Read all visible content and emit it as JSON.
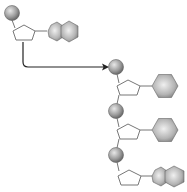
{
  "diagram": {
    "title": "",
    "colors": {
      "background": "#ffffff",
      "phosphate_light": "#e6e6e6",
      "phosphate_dark": "#6a6a6a",
      "base_light": "#ececec",
      "base_dark": "#7d7d7d",
      "sugar_fill": "#ffffff",
      "outline": "#777777",
      "arrow": "#222222"
    },
    "free_nucleotide": {
      "phosphate": {
        "cx": 12,
        "cy": 13,
        "r": 7
      },
      "base_type": "purine"
    },
    "arrow": {
      "from": [
        23,
        42
      ],
      "to": [
        108,
        67
      ],
      "icon": "arrow-right"
    },
    "chain": [
      {
        "phosphate": {
          "cx": 116,
          "cy": 67
        },
        "base_type": "pyrimidine"
      },
      {
        "phosphate": {
          "cx": 116,
          "cy": 111
        },
        "base_type": "pyrimidine"
      },
      {
        "phosphate": {
          "cx": 116,
          "cy": 155
        },
        "base_type": "purine"
      }
    ]
  }
}
